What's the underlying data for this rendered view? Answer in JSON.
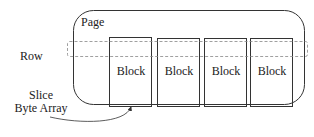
{
  "diagram": {
    "page": {
      "label": "Page"
    },
    "row": {
      "label": "Row"
    },
    "blocks": [
      {
        "label": "Block"
      },
      {
        "label": "Block"
      },
      {
        "label": "Block"
      },
      {
        "label": "Block"
      }
    ],
    "slice": {
      "line1": "Slice",
      "line2": "Byte Array"
    }
  },
  "colors": {
    "stroke": "#333333",
    "dashed": "#888888",
    "background": "#ffffff"
  }
}
